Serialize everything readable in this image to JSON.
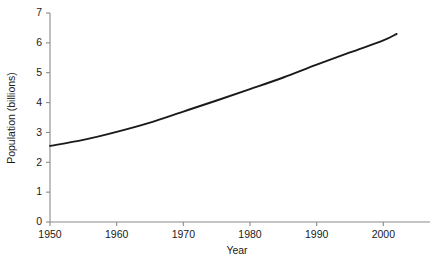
{
  "chart_data": {
    "type": "line",
    "title": "",
    "xlabel": "Year",
    "ylabel": "Population (billions)",
    "xlim": [
      1950,
      2007
    ],
    "ylim": [
      0,
      7
    ],
    "xticks": [
      1950,
      1960,
      1970,
      1980,
      1990,
      2000
    ],
    "xticklabels": [
      "1950",
      "1960",
      "1970",
      "1980",
      "1990",
      "2000"
    ],
    "yticks": [
      0,
      1,
      2,
      3,
      4,
      5,
      6,
      7
    ],
    "yticklabels": [
      "0",
      "1",
      "2",
      "3",
      "4",
      "5",
      "6",
      "7"
    ],
    "grid": false,
    "legend": null,
    "line_color": "#1a1a1a",
    "axis_color": "#8a8a8a",
    "series": [
      {
        "name": "World population",
        "x": [
          1950,
          1955,
          1960,
          1965,
          1970,
          1975,
          1980,
          1985,
          1990,
          1995,
          2000,
          2002
        ],
        "values": [
          2.55,
          2.75,
          3.02,
          3.33,
          3.7,
          4.07,
          4.45,
          4.84,
          5.27,
          5.68,
          6.08,
          6.3
        ]
      }
    ]
  },
  "axes": {
    "y_label": "Population (billions)",
    "x_label": "Year"
  }
}
